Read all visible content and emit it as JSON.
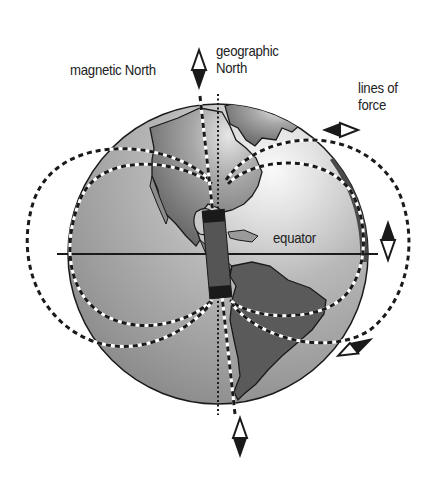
{
  "diagram": {
    "labels": {
      "magnetic_north": "magnetic North",
      "geographic_north_line1": "geographic",
      "geographic_north_line2": "North",
      "lines_of_force_line1": "lines of",
      "lines_of_force_line2": "force",
      "equator": "equator"
    },
    "elements": [
      {
        "id": "globe",
        "type": "sphere",
        "content": "Earth showing North and South America"
      },
      {
        "id": "bar-magnet",
        "type": "bar magnet",
        "orientation": "tilted from geographic axis"
      },
      {
        "id": "geographic-axis",
        "type": "dotted line"
      },
      {
        "id": "magnetic-axis",
        "type": "dashed line"
      },
      {
        "id": "field-lines",
        "type": "dashed loops",
        "count": 4
      },
      {
        "id": "equator-line",
        "type": "solid line"
      },
      {
        "id": "compass-needles",
        "count": 4,
        "positions": [
          "top",
          "upper-right",
          "right",
          "lower-right",
          "bottom"
        ]
      }
    ],
    "colors": {
      "ocean": "#9a9a9a",
      "land": "#6a6a6a",
      "highlight": "#f2f2f2",
      "outline": "#1a1a1a",
      "background": "#ffffff"
    }
  }
}
